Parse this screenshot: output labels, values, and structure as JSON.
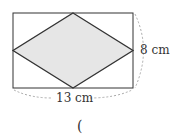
{
  "diagram": {
    "shape": "rhombus inscribed in rectangle",
    "height_label": "8 cm",
    "width_label": "13 cm",
    "answer_open": "(",
    "colors": {
      "fill": "#e6e6e6",
      "stroke": "#333333",
      "dash": "#aaaaaa"
    }
  }
}
